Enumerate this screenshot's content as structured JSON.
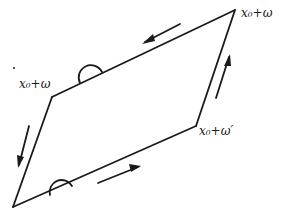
{
  "diagram": {
    "type": "period-parallelogram",
    "vertices": {
      "top_right": "x₀+ω″",
      "left": "x₀+ω",
      "right": "x₀+ω′",
      "bottom_left": ""
    },
    "labels": {
      "top_right": "x₀+ω",
      "left": "x₀+ω",
      "right": "x₀+ω′"
    },
    "arrows": [
      {
        "edge": "top",
        "direction": "toward-left"
      },
      {
        "edge": "right",
        "direction": "upward"
      },
      {
        "edge": "left",
        "direction": "downward"
      },
      {
        "edge": "bottom",
        "direction": "toward-right"
      }
    ],
    "colors": {
      "stroke": "#1a1a1a",
      "background": "#ffffff"
    }
  }
}
